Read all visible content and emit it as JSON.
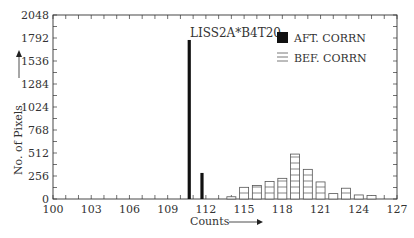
{
  "chart_data": {
    "type": "bar",
    "title": "",
    "annotation": "LISS2A*B4T20",
    "xlabel": "Counts",
    "ylabel": "No. of Pixels",
    "xlim": [
      100,
      127
    ],
    "ylim": [
      0,
      2048
    ],
    "xticks": [
      100,
      103,
      106,
      109,
      112,
      115,
      118,
      121,
      124,
      127
    ],
    "yticks": [
      0,
      256,
      512,
      768,
      1024,
      1284,
      1536,
      1792,
      2048
    ],
    "grid": false,
    "legend_position": "top-right",
    "series": [
      {
        "name": "AFT. CORRN",
        "style": "solid",
        "color": "#111111",
        "x": [
          111,
          112
        ],
        "values": [
          1770,
          290
        ]
      },
      {
        "name": "BEF. CORRN",
        "style": "hatched",
        "color": "#555555",
        "x": [
          114,
          115,
          116,
          117,
          118,
          119,
          120,
          121,
          122,
          123,
          124,
          125
        ],
        "values": [
          25,
          130,
          150,
          195,
          230,
          500,
          330,
          190,
          60,
          120,
          45,
          40
        ]
      }
    ]
  }
}
